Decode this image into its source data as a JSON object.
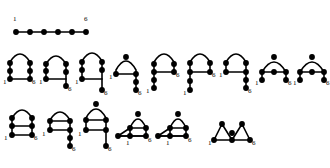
{
  "figure": {
    "title": "",
    "background_color": "#ffffff",
    "ink_color": "#000000",
    "node_radius": 1.9,
    "edge_width": 1.5,
    "endpoint_labels": {
      "start": "1",
      "end": "6"
    },
    "rows": [
      {
        "row_name": "row-1-straight-path",
        "shapes": [
          {
            "shape_name": "straight-path",
            "label_start": "1",
            "label_end": "6",
            "node_count": 6
          }
        ]
      },
      {
        "row_name": "row-2-arches",
        "shapes": [
          {
            "shape_name": "arch-ladder-rung-bottom",
            "label_start": "1",
            "label_end": "6",
            "node_count": 6
          },
          {
            "shape_name": "arch-tail-right-down",
            "label_start": "1",
            "label_end": "6",
            "node_count": 6
          },
          {
            "shape_name": "arch-tall-tail-right",
            "label_start": "1",
            "label_end": "6",
            "node_count": 6
          },
          {
            "shape_name": "arch-short-tail-right",
            "label_start": "1",
            "label_end": "6",
            "node_count": 6
          },
          {
            "shape_name": "arch-rung-tail-left",
            "label_start": "1",
            "label_end": "6",
            "node_count": 6
          },
          {
            "shape_name": "arch-rung-mid",
            "label_start": "1",
            "label_end": "6",
            "node_count": 6
          },
          {
            "shape_name": "arch-tail-right-low",
            "label_start": "1",
            "label_end": "6",
            "node_count": 6
          },
          {
            "shape_name": "arch-wide-rung",
            "label_start": "1",
            "label_end": "6",
            "node_count": 6
          },
          {
            "shape_name": "arch-wide-plain",
            "label_start": "1",
            "label_end": "6",
            "node_count": 6
          }
        ]
      },
      {
        "row_name": "row-3-arches-and-triangles",
        "shapes": [
          {
            "shape_name": "arch-double-rung",
            "label_start": "1",
            "label_end": "6",
            "node_count": 6
          },
          {
            "shape_name": "arch-rung-tail-down",
            "label_start": "1",
            "label_end": "6",
            "node_count": 6
          },
          {
            "shape_name": "arch-rung-tail-down-2",
            "label_start": "1",
            "label_end": "6",
            "node_count": 6
          },
          {
            "shape_name": "triangle-loop-right",
            "label_start": "1",
            "label_end": "6",
            "node_count": 6
          },
          {
            "shape_name": "triangle-loop-left",
            "label_start": "1",
            "label_end": "6",
            "node_count": 6
          },
          {
            "shape_name": "double-arch-zigzag",
            "label_start": "1",
            "label_end": "6",
            "node_count": 6
          }
        ]
      }
    ]
  }
}
